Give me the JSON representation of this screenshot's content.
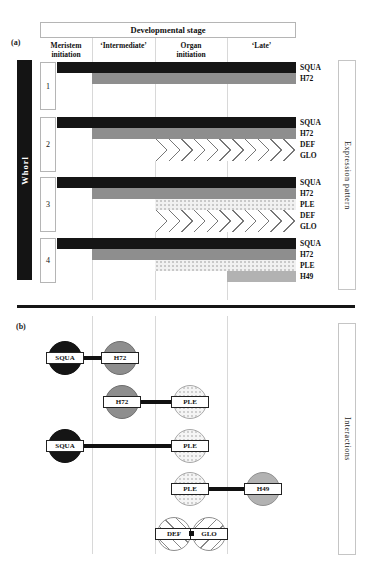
{
  "figure": {
    "type": "scientific-figure",
    "topic": "Floral whorl gene expression patterns and protein interactions",
    "colors": {
      "solid_black": "#151515",
      "dark_gray": "#8e8e8e",
      "light_gray": "#b2b2b2",
      "stipple_pale": "#f1f1f1",
      "hatch_line": "#777777",
      "gridline": "#d8d8d8",
      "divider": "#161616"
    }
  },
  "panel_a": {
    "label": "(a)",
    "header_title": "Developmental stage",
    "stages": [
      "Meristem\ninitiation",
      "‘Intermediate’",
      "Organ\ninitiation",
      "‘Late’"
    ],
    "whorl_axis": "Whorl",
    "right_label": "Expression pattern",
    "whorls": [
      {
        "number": "1",
        "genes": [
          {
            "name": "SQUA",
            "pattern": "solid-black",
            "start": "Meristem initiation",
            "end": "Late"
          },
          {
            "name": "H72",
            "pattern": "dark-gray",
            "start": "Intermediate",
            "end": "Late"
          }
        ]
      },
      {
        "number": "2",
        "genes": [
          {
            "name": "SQUA",
            "pattern": "solid-black",
            "start": "Meristem initiation",
            "end": "Late"
          },
          {
            "name": "H72",
            "pattern": "dark-gray",
            "start": "Intermediate",
            "end": "Late"
          },
          {
            "name": "DEF",
            "pattern": "hatch-backslash",
            "start": "Organ initiation",
            "end": "Late"
          },
          {
            "name": "GLO",
            "pattern": "hatch-slash",
            "start": "Organ initiation",
            "end": "Late"
          }
        ]
      },
      {
        "number": "3",
        "genes": [
          {
            "name": "SQUA",
            "pattern": "solid-black",
            "start": "Meristem initiation",
            "end": "Late"
          },
          {
            "name": "H72",
            "pattern": "dark-gray",
            "start": "Intermediate",
            "end": "Late"
          },
          {
            "name": "PLE",
            "pattern": "stipple-pale",
            "start": "Organ initiation",
            "end": "Late"
          },
          {
            "name": "DEF",
            "pattern": "hatch-backslash",
            "start": "Organ initiation",
            "end": "Late"
          },
          {
            "name": "GLO",
            "pattern": "hatch-slash",
            "start": "Organ initiation",
            "end": "Late"
          }
        ]
      },
      {
        "number": "4",
        "genes": [
          {
            "name": "SQUA",
            "pattern": "solid-black",
            "start": "Meristem initiation",
            "end": "Late"
          },
          {
            "name": "H72",
            "pattern": "dark-gray",
            "start": "Intermediate",
            "end": "Late"
          },
          {
            "name": "PLE",
            "pattern": "stipple-pale",
            "start": "Organ initiation",
            "end": "Late"
          },
          {
            "name": "H49",
            "pattern": "light-gray",
            "start": "Late",
            "end": "Late"
          }
        ]
      }
    ]
  },
  "panel_b": {
    "label": "(b)",
    "right_label": "Interactions",
    "interactions": [
      {
        "left": {
          "name": "SQUA",
          "pattern": "solid-black"
        },
        "right": {
          "name": "H72",
          "pattern": "dark-gray"
        },
        "connector": "bar"
      },
      {
        "left": {
          "name": "H72",
          "pattern": "dark-gray"
        },
        "right": {
          "name": "PLE",
          "pattern": "stipple-pale"
        },
        "connector": "bar"
      },
      {
        "left": {
          "name": "SQUA",
          "pattern": "solid-black"
        },
        "right": {
          "name": "PLE",
          "pattern": "stipple-pale"
        },
        "connector": "bar"
      },
      {
        "left": {
          "name": "PLE",
          "pattern": "stipple-pale"
        },
        "right": {
          "name": "H49",
          "pattern": "light-gray"
        },
        "connector": "bar"
      },
      {
        "left": {
          "name": "DEF",
          "pattern": "hatch-backslash"
        },
        "right": {
          "name": "GLO",
          "pattern": "hatch-slash"
        },
        "connector": "abutting-square"
      }
    ]
  }
}
